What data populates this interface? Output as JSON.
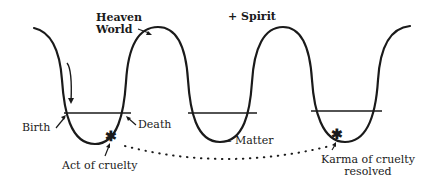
{
  "diagram": {
    "labels": {
      "heaven_world_line1": "Heaven",
      "heaven_world_line2": "World",
      "spirit": "+  Spirit",
      "matter": "–  Matter",
      "birth": "Birth",
      "death": "Death",
      "act_of_cruelty": "Act of cruelty",
      "karma_line1": "Karma of cruelty",
      "karma_line2": "resolved"
    },
    "markers": {
      "act_symbol": "✱",
      "karma_symbol": "✱"
    },
    "colors": {
      "ink": "#1a1a1a",
      "background": "#ffffff"
    }
  }
}
